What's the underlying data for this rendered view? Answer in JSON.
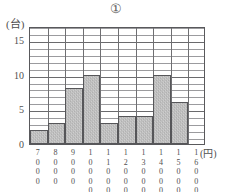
{
  "chart_data": {
    "type": "bar",
    "title": "①",
    "xlabel": "(円)",
    "ylabel": "(台)",
    "categories": [
      "7000",
      "8000",
      "9000",
      "10000",
      "11000",
      "12000",
      "13000",
      "14000",
      "15000",
      "16000"
    ],
    "values": [
      2,
      3,
      8,
      10,
      3,
      4,
      4,
      10,
      6,
      0
    ],
    "ylim": [
      0,
      17
    ],
    "y_major_ticks": [
      0,
      5,
      10,
      15
    ],
    "y_minor_step": 1,
    "grid": true,
    "legend": "none",
    "bar_color": "#a6a6a6",
    "bar_edge_color": "#565659",
    "grid_color": "#9b9b9e",
    "axis_color": "#59595c"
  },
  "y_tick_labels": [
    "15",
    "10",
    "5",
    "0"
  ],
  "x_tick_labels": [
    [
      "7",
      "0",
      "0",
      "0"
    ],
    [
      "8",
      "0",
      "0",
      "0"
    ],
    [
      "9",
      "0",
      "0",
      "0"
    ],
    [
      "1",
      "0",
      "0",
      "0",
      "0"
    ],
    [
      "1",
      "1",
      "0",
      "0",
      "0"
    ],
    [
      "1",
      "2",
      "0",
      "0",
      "0"
    ],
    [
      "1",
      "3",
      "0",
      "0",
      "0"
    ],
    [
      "1",
      "4",
      "0",
      "0",
      "0"
    ],
    [
      "1",
      "5",
      "0",
      "0",
      "0"
    ],
    [
      "1",
      "6",
      "0",
      "0",
      "0"
    ]
  ]
}
